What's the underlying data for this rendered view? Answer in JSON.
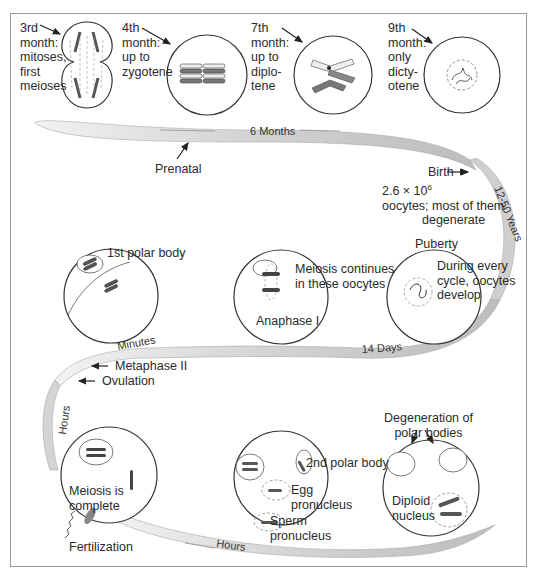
{
  "figure": {
    "colors": {
      "ribbon": "#d9d9d9",
      "ribbon_dark": "#b5b5b5",
      "line": "#333333",
      "chromosome_dark": "#555555",
      "chromosome_light": "#ececec"
    }
  },
  "stages": {
    "month3": {
      "lines": [
        "3rd",
        "month:",
        "mitoses,",
        "first",
        "meioses"
      ]
    },
    "month4": {
      "lines": [
        "4th",
        "month:",
        "up to",
        "zygotene"
      ]
    },
    "month7": {
      "lines": [
        "7th",
        "month:",
        "up to",
        "diplo-",
        "tene"
      ]
    },
    "month9": {
      "lines": [
        "9th",
        "month:",
        "only",
        "dicty-",
        "otene"
      ]
    }
  },
  "timeline": {
    "six_months": "6 Months",
    "prenatal": "Prenatal",
    "birth": "Birth",
    "years": "12-50 Years",
    "fourteen_days": "14 Days",
    "minutes": "Minutes",
    "hours_vertical": "Hours",
    "hours_bottom": "Hours"
  },
  "annotations": {
    "oocyte_count_line1": "2.6 × 10",
    "oocyte_count_exp": "6",
    "oocyte_count_line2": "oocytes; most of them",
    "oocyte_count_line3": "degenerate",
    "puberty": "Puberty",
    "puberty_desc": [
      "During every",
      "cycle, oocytes",
      "develop"
    ],
    "meiosis_continues": [
      "Meiosis continues",
      "in these oocytes"
    ],
    "anaphase": "Anaphase I",
    "first_polar_body": "1st polar body",
    "metaphase2": "Metaphase II",
    "ovulation": "Ovulation",
    "meiosis_complete": [
      "Meiosis is",
      "complete"
    ],
    "fertilization": "Fertilization",
    "second_polar_body": "2nd polar body",
    "egg_pronucleus": [
      "Egg",
      "pronucleus"
    ],
    "sperm_pronucleus": [
      "Sperm",
      "pronucleus"
    ],
    "degeneration": [
      "Degeneration of",
      "polar bodies"
    ],
    "diploid": [
      "Diploid",
      "nucleus"
    ]
  }
}
